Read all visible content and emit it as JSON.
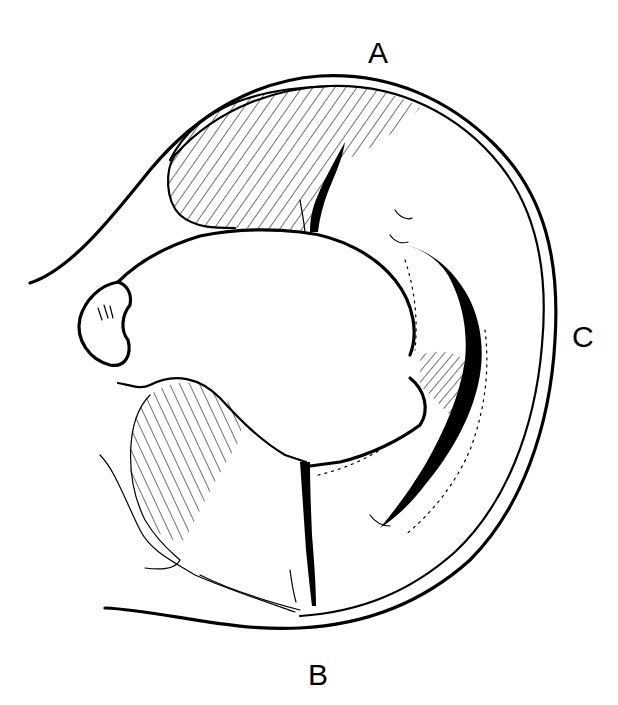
{
  "figure": {
    "type": "line-drawing",
    "labels": {
      "top": "A",
      "bottom": "B",
      "right": "C"
    },
    "colors": {
      "ink": "#000000",
      "background": "#ffffff"
    }
  }
}
